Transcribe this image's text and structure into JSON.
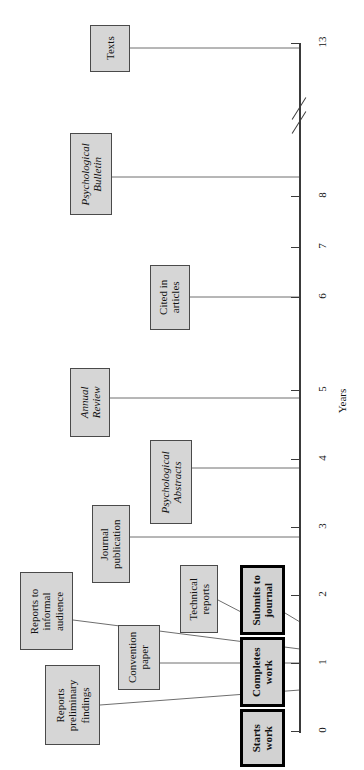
{
  "figure": {
    "orientation": "rotated-90",
    "axis_title": "Years",
    "box_fill": "#d6d6d6",
    "box_border": "#4a4a4a",
    "highlight_border": "#000000",
    "line_color": "#6e6e6e"
  },
  "axis": {
    "ticks": [
      {
        "label": "0",
        "value": 0,
        "y": 731
      },
      {
        "label": "1",
        "value": 1,
        "y": 663
      },
      {
        "label": "2",
        "value": 2,
        "y": 595
      },
      {
        "label": "3",
        "value": 3,
        "y": 527
      },
      {
        "label": "4",
        "value": 4,
        "y": 459
      },
      {
        "label": "5",
        "value": 5,
        "y": 390
      },
      {
        "label": "6",
        "value": 6,
        "y": 297
      },
      {
        "label": "7",
        "value": 7,
        "y": 247
      },
      {
        "label": "8",
        "value": 8,
        "y": 196
      },
      {
        "label": "13",
        "value": 13,
        "y": 43
      }
    ],
    "has_break": true,
    "break_between": [
      "8",
      "13"
    ]
  },
  "events": [
    {
      "id": "starts-work",
      "label": "Starts\nwork",
      "style": "bold",
      "year": 0.0
    },
    {
      "id": "completes-work",
      "label": "Completes\nwork",
      "style": "bold",
      "year": 1.0
    },
    {
      "id": "submits-to-journal",
      "label": "Submits to\njournal",
      "style": "bold",
      "year": 2.0
    },
    {
      "id": "reports-preliminary",
      "label": "Reports\npreliminary\nfindings",
      "style": "plain",
      "year": 0.7
    },
    {
      "id": "reports-informal",
      "label": "Reports to\ninformal\naudience",
      "style": "plain",
      "year": 1.5
    },
    {
      "id": "convention-paper",
      "label": "Convention\npaper",
      "style": "plain",
      "year": 1.0
    },
    {
      "id": "technical-reports",
      "label": "Technical\nreports",
      "style": "plain",
      "year": 1.8
    },
    {
      "id": "journal-publication",
      "label": "Journal\npublication",
      "style": "plain",
      "year": 2.8
    },
    {
      "id": "psychological-abstracts",
      "label": "Psychological\nAbstracts",
      "style": "italic",
      "year": 4.0
    },
    {
      "id": "annual-review",
      "label": "Annual\nReview",
      "style": "italic",
      "year": 4.9
    },
    {
      "id": "cited-in-articles",
      "label": "Cited in\narticles",
      "style": "plain",
      "year": 6.4
    },
    {
      "id": "psychological-bulletin",
      "label": "Psychological\nBulletin",
      "style": "italic",
      "year": 8.2
    },
    {
      "id": "texts",
      "label": "Texts",
      "style": "plain",
      "year": 13.0
    }
  ]
}
